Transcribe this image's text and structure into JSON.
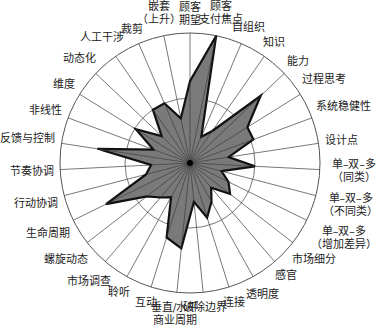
{
  "chart_data": {
    "type": "radar",
    "title": "",
    "center": [
      190,
      163
    ],
    "outer_radius": 130,
    "grid_rings": [
      0.5,
      1.0
    ],
    "fill_color": "#7a7a7a",
    "stroke_color": "#111111",
    "grid_color": "#555555",
    "axes": [
      {
        "label": "顾客期望",
        "value": 0.63
      },
      {
        "label": "顾客支付焦点",
        "value": 1.0
      },
      {
        "label": "自组织",
        "value": 0.22
      },
      {
        "label": "知识",
        "value": 0.3
      },
      {
        "label": "能力",
        "value": 0.75
      },
      {
        "label": "过程思考",
        "value": 0.52
      },
      {
        "label": "系统稳健性",
        "value": 0.52
      },
      {
        "label": "设计点",
        "value": 0.3
      },
      {
        "label": "单-双-多（同类）",
        "value": 0.5
      },
      {
        "label": "单-双-多（不同类）",
        "value": 0.25
      },
      {
        "label": "单-双-多（增加差异）",
        "value": 0.33
      },
      {
        "label": "市场细分",
        "value": 0.39
      },
      {
        "label": "感官",
        "value": 0.25
      },
      {
        "label": "透明度",
        "value": 0.34
      },
      {
        "label": "连接",
        "value": 0.44
      },
      {
        "label": "破除边界",
        "value": 0.3
      },
      {
        "label": "垂直/水平商业周期",
        "value": 0.66
      },
      {
        "label": "互动",
        "value": 0.6
      },
      {
        "label": "聆听",
        "value": 0.3
      },
      {
        "label": "市场调查",
        "value": 0.35
      },
      {
        "label": "螺旋动态",
        "value": 0.42
      },
      {
        "label": "生命周期",
        "value": 0.72
      },
      {
        "label": "行动协调",
        "value": 0.35
      },
      {
        "label": "节奏协调",
        "value": 0.3
      },
      {
        "label": "反馈与控制",
        "value": 0.72
      },
      {
        "label": "非线性",
        "value": 0.3
      },
      {
        "label": "维度",
        "value": 0.49
      },
      {
        "label": "动态化",
        "value": 0.3
      },
      {
        "label": "人工干涉",
        "value": 0.5
      },
      {
        "label": "裁剪",
        "value": 0.5
      },
      {
        "label": "嵌套（上升）",
        "value": 0.35
      }
    ],
    "label_lines": [
      [
        "顾客",
        "期望"
      ],
      [
        "顾客",
        "支付焦点"
      ],
      [
        "自组织"
      ],
      [
        "知识"
      ],
      [
        "能力"
      ],
      [
        "过程思考"
      ],
      [
        "系统稳健性"
      ],
      [
        "设计点"
      ],
      [
        "单–双–多",
        "（同类）"
      ],
      [
        "单–双–多",
        "（不同类）"
      ],
      [
        "单–双–多",
        "（增加差异）"
      ],
      [
        "市场细分"
      ],
      [
        "感官"
      ],
      [
        "透明度"
      ],
      [
        "连接"
      ],
      [
        "破除边界"
      ],
      [
        "垂直/水平",
        "商业周期"
      ],
      [
        "互动"
      ],
      [
        "聆听"
      ],
      [
        "市场调查"
      ],
      [
        "螺旋动态"
      ],
      [
        "生命周期"
      ],
      [
        "行动协调"
      ],
      [
        "节奏协调"
      ],
      [
        "反馈与控制"
      ],
      [
        "非线性"
      ],
      [
        "维度"
      ],
      [
        "动态化"
      ],
      [
        "人工干涉"
      ],
      [
        "裁剪"
      ],
      [
        "嵌套",
        "（上升）"
      ]
    ],
    "legend": null,
    "grid": true
  }
}
